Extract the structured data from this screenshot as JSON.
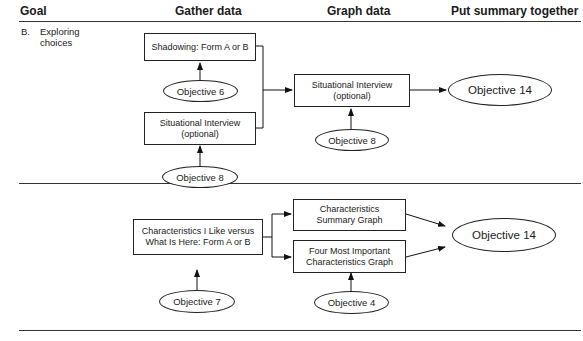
{
  "headers": {
    "goal": "Goal",
    "gather": "Gather data",
    "graph": "Graph data",
    "summary": "Put summary together"
  },
  "section_b": {
    "goal_letter": "B.",
    "goal_text": "Exploring\nchoices",
    "gather_boxes": [
      "Shadowing: Form A or B",
      "Situational Interview\n(optional)"
    ],
    "gather_objectives": [
      "Objective 6",
      "Objective 8"
    ],
    "graph_box": "Situational Interview\n(optional)",
    "graph_objective": "Objective 8",
    "summary_objective": "Objective 14"
  },
  "section_c": {
    "gather_box": "Characteristics I Like versus\nWhat Is Here: Form A or B",
    "gather_objective": "Objective 7",
    "graph_boxes": [
      "Characteristics\nSummary Graph",
      "Four Most Important\nCharacteristics Graph"
    ],
    "graph_objective": "Objective 4",
    "summary_objective": "Objective 14"
  }
}
